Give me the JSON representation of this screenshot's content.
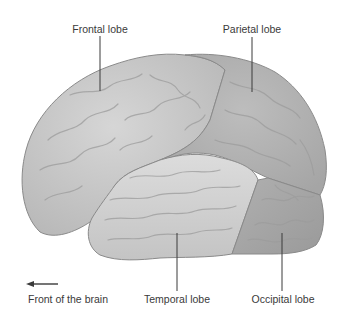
{
  "diagram": {
    "labels": {
      "frontal": "Frontal lobe",
      "parietal": "Parietal lobe",
      "temporal": "Temporal lobe",
      "occipital": "Occipital lobe",
      "front": "Front of the brain"
    },
    "colors": {
      "background": "#ffffff",
      "frontal": "#c9c9c9",
      "parietal": "#b4b4b4",
      "temporal": "#d2d2d2",
      "occipital": "#a8a8a8",
      "outline": "#8a8a8a",
      "leader_line": "#3a3a3a",
      "text": "#3a3a3a"
    }
  }
}
